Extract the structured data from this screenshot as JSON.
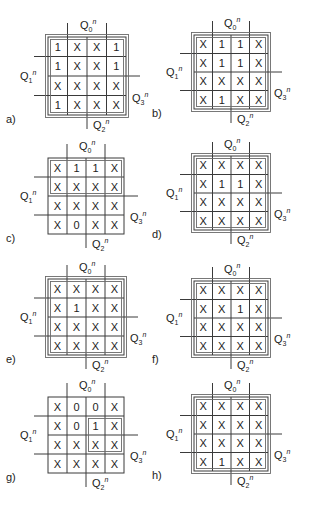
{
  "figure": {
    "variables": {
      "top": {
        "base": "Q",
        "sub": "0",
        "sup": "n"
      },
      "left": {
        "base": "Q",
        "sub": "1",
        "sup": "n"
      },
      "right": {
        "base": "Q",
        "sub": "3",
        "sup": "n"
      },
      "bottom": {
        "base": "Q",
        "sub": "2",
        "sup": "n"
      }
    },
    "colors": {
      "line": "#3a3a3a",
      "loop": "#6a6a6a",
      "text": "#222222"
    },
    "maps": [
      {
        "label": "a)",
        "x": 48,
        "y": 37,
        "cell": 19.5,
        "cells": [
          [
            "1",
            "X",
            "X",
            "1"
          ],
          [
            "1",
            "X",
            "X",
            "1"
          ],
          [
            "X",
            "X",
            "X",
            "X"
          ],
          [
            "1",
            "X",
            "X",
            "X"
          ]
        ],
        "loops": [
          {
            "r0": 0,
            "c0": 0,
            "r1": 3,
            "c1": 3,
            "double": true
          }
        ]
      },
      {
        "label": "b)",
        "x": 194,
        "y": 35,
        "cell": 18.5,
        "cells": [
          [
            "X",
            "1",
            "1",
            "X"
          ],
          [
            "X",
            "1",
            "1",
            "X"
          ],
          [
            "X",
            "X",
            "X",
            "X"
          ],
          [
            "X",
            "1",
            "X",
            "X"
          ]
        ],
        "loops": [
          {
            "r0": 0,
            "c0": 0,
            "r1": 3,
            "c1": 3,
            "double": true
          }
        ]
      },
      {
        "label": "c)",
        "x": 48,
        "y": 158,
        "cell": 19,
        "cells": [
          [
            "X",
            "1",
            "1",
            "X"
          ],
          [
            "X",
            "X",
            "X",
            "X"
          ],
          [
            "X",
            "X",
            "X",
            "X"
          ],
          [
            "X",
            "0",
            "X",
            "X"
          ]
        ],
        "loops": [
          {
            "r0": 0,
            "c0": 0,
            "r1": 1,
            "c1": 3,
            "double": false
          }
        ]
      },
      {
        "label": "d)",
        "x": 194,
        "y": 156,
        "cell": 18.5,
        "cells": [
          [
            "X",
            "X",
            "X",
            "X"
          ],
          [
            "X",
            "1",
            "1",
            "X"
          ],
          [
            "X",
            "X",
            "X",
            "X"
          ],
          [
            "X",
            "X",
            "X",
            "X"
          ]
        ],
        "loops": [
          {
            "r0": 0,
            "c0": 0,
            "r1": 3,
            "c1": 3,
            "double": true
          }
        ]
      },
      {
        "label": "e)",
        "x": 48,
        "y": 279,
        "cell": 19,
        "cells": [
          [
            "X",
            "X",
            "X",
            "X"
          ],
          [
            "X",
            "1",
            "X",
            "X"
          ],
          [
            "X",
            "X",
            "X",
            "X"
          ],
          [
            "X",
            "X",
            "X",
            "X"
          ]
        ],
        "loops": [
          {
            "r0": 0,
            "c0": 0,
            "r1": 3,
            "c1": 3,
            "double": true
          }
        ]
      },
      {
        "label": "f)",
        "x": 194,
        "y": 281,
        "cell": 18.5,
        "cells": [
          [
            "X",
            "X",
            "X",
            "X"
          ],
          [
            "X",
            "X",
            "1",
            "X"
          ],
          [
            "X",
            "X",
            "X",
            "X"
          ],
          [
            "X",
            "X",
            "X",
            "X"
          ]
        ],
        "loops": [
          {
            "r0": 0,
            "c0": 0,
            "r1": 3,
            "c1": 3,
            "double": true
          }
        ]
      },
      {
        "label": "g)",
        "x": 48,
        "y": 397,
        "cell": 19,
        "cells": [
          [
            "X",
            "0",
            "0",
            "X"
          ],
          [
            "X",
            "0",
            "1",
            "X"
          ],
          [
            "X",
            "X",
            "X",
            "X"
          ],
          [
            "X",
            "X",
            "X",
            "X"
          ]
        ],
        "loops": [
          {
            "r0": 1,
            "c0": 2,
            "r1": 2,
            "c1": 3,
            "double": false
          }
        ]
      },
      {
        "label": "h)",
        "x": 194,
        "y": 397,
        "cell": 18.5,
        "cells": [
          [
            "X",
            "X",
            "X",
            "X"
          ],
          [
            "X",
            "X",
            "X",
            "X"
          ],
          [
            "X",
            "X",
            "X",
            "X"
          ],
          [
            "X",
            "1",
            "X",
            "X"
          ]
        ],
        "loops": [
          {
            "r0": 0,
            "c0": 0,
            "r1": 3,
            "c1": 3,
            "double": true
          }
        ]
      }
    ]
  }
}
